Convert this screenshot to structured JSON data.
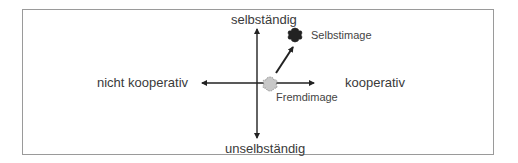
{
  "diagram": {
    "axes": {
      "top": "selbständig",
      "bottom": "unselbständig",
      "left": "nicht kooperativ",
      "right": "kooperativ"
    },
    "points": [
      {
        "label": "Selbstimage",
        "shape": "dark-cross-blob",
        "color": "#222222"
      },
      {
        "label": "Fremdimage",
        "shape": "light-cross-blob",
        "color": "#c8c8c8"
      }
    ],
    "arrow": {
      "from": "Fremdimage",
      "to": "Selbstimage"
    },
    "colors": {
      "axis": "#222222",
      "frame": "#9a9a9a",
      "selbstimage": "#222222",
      "fremdimage": "#c8c8c8"
    }
  }
}
